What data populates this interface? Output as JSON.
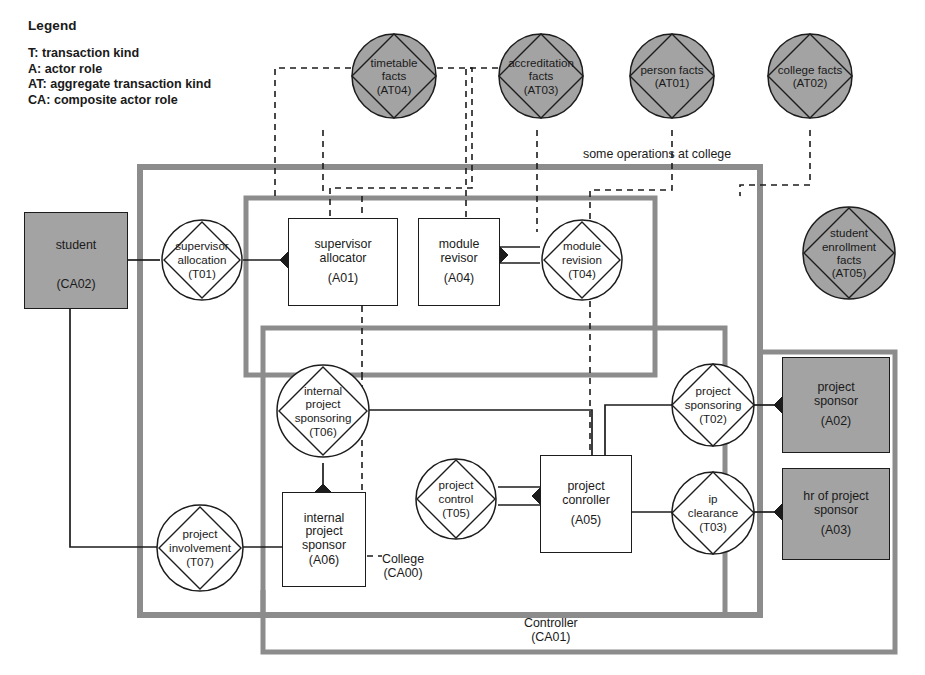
{
  "legend": {
    "title": "Legend",
    "rows": [
      "T: transaction kind",
      "A: actor role",
      "AT: aggregate transaction kind",
      "CA: composite actor role"
    ]
  },
  "captions": {
    "scope_note": "some operations at college",
    "college_name": "College",
    "college_code": "(CA00)",
    "controller_name": "Controller",
    "controller_code": "(CA01)"
  },
  "colors": {
    "fill_gray": "#a3a3a3",
    "stroke_dark": "#1c1c1c",
    "frame_gray": "#8c8c8c",
    "paper": "#ffffff"
  },
  "aggregate_transaction_kinds": [
    {
      "id": "AT04",
      "name": "timetable\nfacts",
      "label_lines": [
        "timetable",
        "facts"
      ],
      "code": "(AT04)"
    },
    {
      "id": "AT03",
      "name": "accreditation facts",
      "label_lines": [
        "accreditation",
        "facts"
      ],
      "code": "(AT03)"
    },
    {
      "id": "AT01",
      "name": "person facts",
      "label_lines": [
        "person facts"
      ],
      "code": "(AT01)"
    },
    {
      "id": "AT02",
      "name": "college facts",
      "label_lines": [
        "college facts"
      ],
      "code": "(AT02)"
    },
    {
      "id": "AT05",
      "name": "student enrollment facts",
      "label_lines": [
        "student",
        "enrollment",
        "facts"
      ],
      "code": "(AT05)"
    }
  ],
  "transaction_kinds": [
    {
      "id": "T01",
      "label_lines": [
        "supervisor",
        "allocation"
      ],
      "code": "(T01)"
    },
    {
      "id": "T04",
      "label_lines": [
        "module",
        "revision"
      ],
      "code": "(T04)"
    },
    {
      "id": "T06",
      "label_lines": [
        "internal",
        "project",
        "sponsoring"
      ],
      "code": "(T06)"
    },
    {
      "id": "T02",
      "label_lines": [
        "project",
        "sponsoring"
      ],
      "code": "(T02)"
    },
    {
      "id": "T05",
      "label_lines": [
        "project",
        "control"
      ],
      "code": "(T05)"
    },
    {
      "id": "T03",
      "label_lines": [
        "ip",
        "clearance"
      ],
      "code": "(T03)"
    },
    {
      "id": "T07",
      "label_lines": [
        "project",
        "involvement"
      ],
      "code": "(T07)"
    }
  ],
  "actor_roles": [
    {
      "id": "A01",
      "label_lines": [
        "supervisor",
        "allocator"
      ],
      "code": "(A01)",
      "fill": "white"
    },
    {
      "id": "A04",
      "label_lines": [
        "module",
        "revisor"
      ],
      "code": "(A04)",
      "fill": "white"
    },
    {
      "id": "A05",
      "label_lines": [
        "project",
        "conroller"
      ],
      "code": "(A05)",
      "fill": "white"
    },
    {
      "id": "A06",
      "label_lines": [
        "internal",
        "project",
        "sponsor"
      ],
      "code": "(A06)",
      "fill": "white"
    },
    {
      "id": "A02",
      "label_lines": [
        "project",
        "sponsor"
      ],
      "code": "(A02)",
      "fill": "gray"
    },
    {
      "id": "A03",
      "label_lines": [
        "hr of project",
        "sponsor"
      ],
      "code": "(A03)",
      "fill": "gray"
    },
    {
      "id": "CA02",
      "label_lines": [
        "student"
      ],
      "code": "(CA02)",
      "fill": "gray"
    }
  ]
}
